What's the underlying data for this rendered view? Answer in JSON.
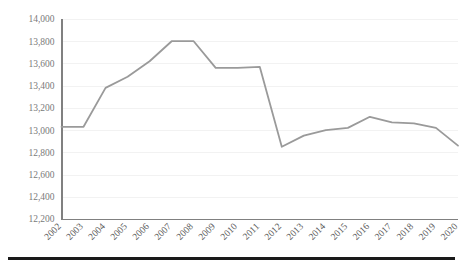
{
  "chart_data": {
    "type": "line",
    "title": "",
    "subtitle": "",
    "xlabel": "",
    "ylabel": "",
    "categories": [
      "2002",
      "2003",
      "2004",
      "2005",
      "2006",
      "2007",
      "2008",
      "2009",
      "2010",
      "2011",
      "2012",
      "2013",
      "2014",
      "2015",
      "2016",
      "2017",
      "2018",
      "2019",
      "2020"
    ],
    "series": [
      {
        "name": "series-1",
        "color": "#9a9a9a",
        "values": [
          13030,
          13030,
          13380,
          13480,
          13620,
          13800,
          13800,
          13560,
          13560,
          13570,
          12850,
          12950,
          13000,
          13020,
          13120,
          13070,
          13060,
          13020,
          12860
        ]
      }
    ],
    "ylim": [
      12200,
      14000
    ],
    "ytick_values": [
      12200,
      12400,
      12600,
      12800,
      13000,
      13200,
      13400,
      13600,
      13800,
      14000
    ],
    "ytick_labels": [
      "12,200",
      "12,400",
      "12,600",
      "12,800",
      "13,000",
      "13,200",
      "13,400",
      "13,600",
      "13,800",
      "14,000"
    ],
    "grid": true,
    "grid_axis": "y",
    "legend": false,
    "legend_position": "none",
    "xtick_rotation": 45
  },
  "colors": {
    "line": "#9a9a9a",
    "axis": "#808080",
    "grid": "#f2f2f2",
    "tick_text": "#7a7a7a",
    "xtick_text": "#5a5a5a",
    "bottom_rule": "#1a1a1a",
    "background": "#ffffff"
  },
  "footer": {
    "rule_label": "bottom-divider"
  }
}
